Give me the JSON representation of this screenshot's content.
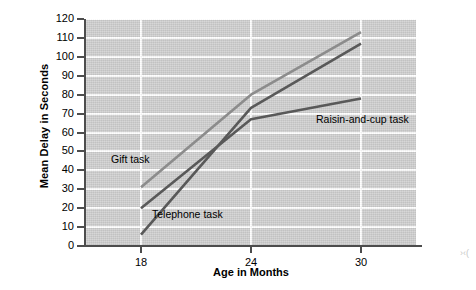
{
  "chart_data": {
    "type": "line",
    "title": "",
    "xlabel": "Age in Months",
    "ylabel": "Mean Delay in Seconds",
    "x": [
      18,
      24,
      30
    ],
    "xtick_labels": [
      "18",
      "24",
      "30"
    ],
    "ytick_labels": [
      "0",
      "10",
      "20",
      "30",
      "40",
      "50",
      "60",
      "70",
      "80",
      "90",
      "100",
      "110",
      "120"
    ],
    "ylim": [
      0,
      120
    ],
    "xlim": [
      15,
      33
    ],
    "ytick_step": 10,
    "grid": "horizontal-and-vertical",
    "legend_position": "inline-annotations",
    "plot_background": "#cfcfcf",
    "grid_color": "#ffffff",
    "axis_color": "#4d4d4d",
    "series": [
      {
        "name": "Gift task",
        "label": "Gift task",
        "color": "#8c8c8c",
        "values": [
          31,
          80,
          113
        ]
      },
      {
        "name": "Telephone task",
        "label": "Telephone task",
        "color": "#595959",
        "values": [
          6,
          73,
          107
        ]
      },
      {
        "name": "Raisin-and-cup task",
        "label": "Raisin-and-cup task",
        "color": "#595959",
        "values": [
          20,
          67,
          78
        ]
      }
    ]
  },
  "edge_artifact": "›‹("
}
